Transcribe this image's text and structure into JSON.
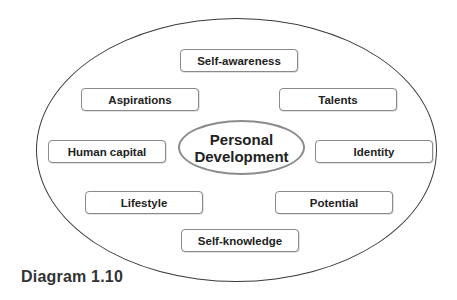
{
  "diagram": {
    "center": {
      "line1": "Personal",
      "line2": "Development"
    },
    "nodes": [
      {
        "id": "self-awareness",
        "label": "Self-awareness"
      },
      {
        "id": "aspirations",
        "label": "Aspirations"
      },
      {
        "id": "talents",
        "label": "Talents"
      },
      {
        "id": "human-capital",
        "label": "Human capital"
      },
      {
        "id": "identity",
        "label": "Identity"
      },
      {
        "id": "lifestyle",
        "label": "Lifestyle"
      },
      {
        "id": "potential",
        "label": "Potential"
      },
      {
        "id": "self-knowledge",
        "label": "Self-knowledge"
      }
    ],
    "caption": "Diagram 1.10",
    "colors": {
      "outer_border": "#3a3a3a",
      "box_border": "#8a8a8a",
      "center_border": "#8c8c8c",
      "text": "#222222"
    }
  }
}
